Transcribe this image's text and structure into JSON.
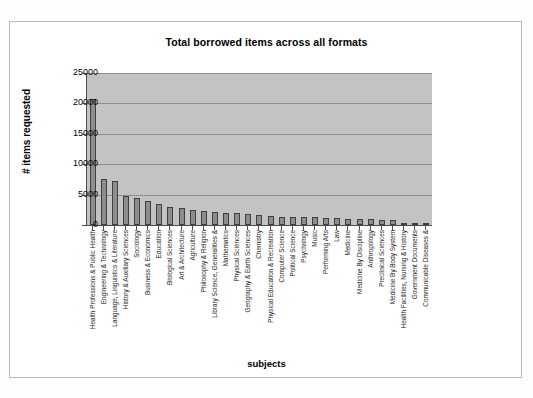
{
  "chart_data": {
    "type": "bar",
    "title": "Total borrowed items across all formats",
    "xlabel": "subjects",
    "ylabel": "# items requested",
    "ylim": [
      0,
      25000
    ],
    "ytick_labels": [
      "25000",
      "20000",
      "15000",
      "10000",
      "5000",
      "0"
    ],
    "ytick_values": [
      25000,
      20000,
      15000,
      10000,
      5000,
      0
    ],
    "grid": true,
    "legend": "none",
    "orientation": "vertical",
    "categories": [
      "Health Professions & Public Health",
      "Engineering & Technology",
      "Language, Linguistics & Literature",
      "History & Auxiliary Sciences",
      "Sociology",
      "Business & Economics",
      "Education",
      "Biological Sciences",
      "Art & Architecture",
      "Agriculture",
      "Philosophy & Religion",
      "Library Science, Generalities &",
      "Mathematics",
      "Physical Sciences",
      "Geography & Earth Sciences",
      "Chemistry",
      "Physical Education & Recreation",
      "Computer Science",
      "Political Science",
      "Psychology",
      "Music",
      "Performing Arts",
      "Law",
      "Medicine",
      "Medicine By Discipline",
      "Anthropology",
      "Preclinical Sciences",
      "Medicine By Body System",
      "Health Facilities, Nursing & History",
      "Government Documents",
      "Communicable Diseases &"
    ],
    "values": [
      20800,
      7500,
      7200,
      4800,
      4400,
      3900,
      3500,
      2900,
      2800,
      2400,
      2300,
      2200,
      2000,
      1900,
      1800,
      1700,
      1500,
      1400,
      1350,
      1300,
      1250,
      1200,
      1150,
      1050,
      1000,
      950,
      900,
      800,
      400,
      300,
      250
    ],
    "colors": {
      "bar_fill": "#8d8d8d",
      "bar_border": "#3f3f3f",
      "plot_background": "#c3c3c3",
      "gridline": "#8e8e8e",
      "axis": "#4d4d4d",
      "frame_background": "#ffffff",
      "frame_border": "#b9b9b9",
      "text": "#000000"
    }
  }
}
